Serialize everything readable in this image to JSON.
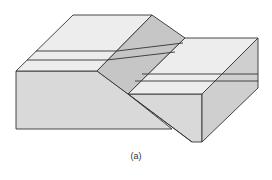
{
  "figure": {
    "caption": "(a)",
    "colors": {
      "top_surface": "#ededed",
      "front_face": "#d9d9d9",
      "fault_plane": "#c6c6c6",
      "side_face": "#cfcfcf",
      "outline": "#333333",
      "background": "#ffffff"
    }
  }
}
